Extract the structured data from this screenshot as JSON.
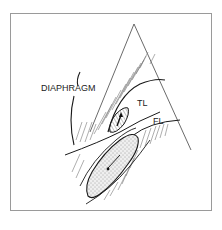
{
  "figure": {
    "labels": {
      "diaphragm": "DIAPHRAGM",
      "true_lumen": "TL",
      "false_lumen": "FL"
    },
    "colors": {
      "frame": "#9a9a9a",
      "ink": "#1a1a1a",
      "hatch": "#555555",
      "stipple_fill": "#e6e6e6",
      "tl_fill": "#c8c8c8"
    }
  }
}
